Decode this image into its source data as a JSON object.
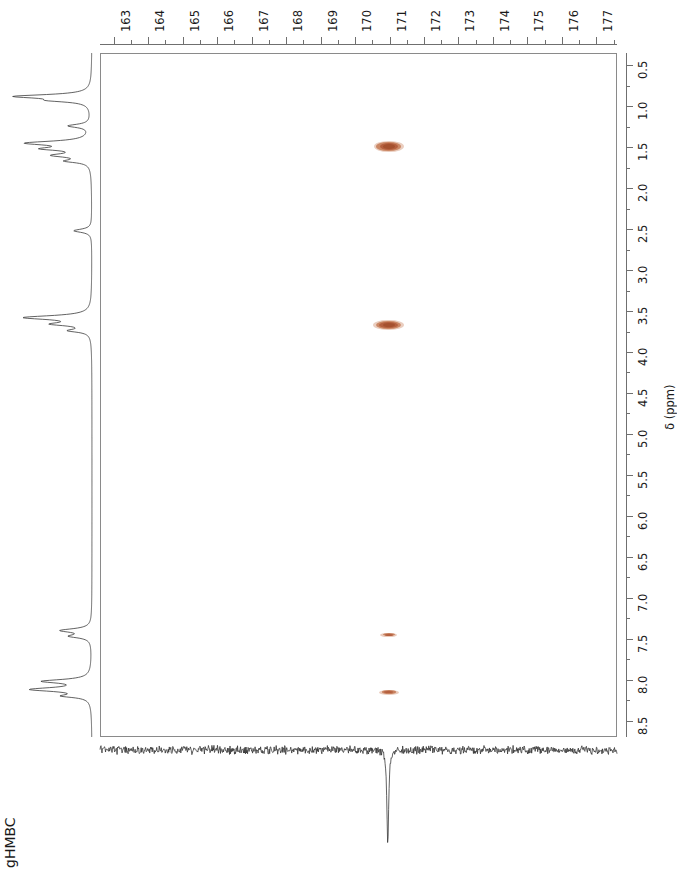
{
  "figure": {
    "experiment_label": "gHMBC",
    "axis_title_f2": "δ (ppm)"
  },
  "chart_data": {
    "type": "heatmap",
    "title": "gHMBC",
    "subtitle": "",
    "xlabel": "",
    "ylabel": "δ (ppm)",
    "x_axis_position": "top",
    "y_axis_position": "right",
    "grid": false,
    "legend": "none",
    "xlim": [
      162.6,
      177.6
    ],
    "ylim": [
      8.7,
      0.35
    ],
    "x_ticks": [
      163,
      164,
      165,
      166,
      167,
      168,
      169,
      170,
      171,
      172,
      173,
      174,
      175,
      176,
      177
    ],
    "x_tick_labels": [
      "163",
      "164",
      "165",
      "166",
      "167",
      "168",
      "169",
      "170",
      "171",
      "172",
      "173",
      "174",
      "175",
      "176",
      "177"
    ],
    "x_minor_tick_step": 0.5,
    "y_ticks": [
      0.5,
      1.0,
      1.5,
      2.0,
      2.5,
      3.0,
      3.5,
      4.0,
      4.5,
      5.0,
      5.5,
      6.0,
      6.5,
      7.0,
      7.5,
      8.0,
      8.5
    ],
    "y_tick_labels": [
      "0.5",
      "1.0",
      "1.5",
      "2.0",
      "2.5",
      "3.0",
      "3.5",
      "4.0",
      "4.5",
      "5.0",
      "5.5",
      "6.0",
      "6.5",
      "7.0",
      "7.5",
      "8.0",
      "8.5"
    ],
    "y_minor_tick_step": 0.25,
    "peak_color": "#b9653f",
    "peaks": [
      {
        "label": "cross-peak-1",
        "c13_ppm": 170.95,
        "h1_ppm": 1.48,
        "c13_width_ppm": 0.88,
        "h1_height_ppm": 0.14,
        "intensity": "strong"
      },
      {
        "label": "cross-peak-2",
        "c13_ppm": 170.95,
        "h1_ppm": 3.66,
        "c13_width_ppm": 0.9,
        "h1_height_ppm": 0.13,
        "intensity": "strong"
      },
      {
        "label": "cross-peak-3",
        "c13_ppm": 170.95,
        "h1_ppm": 7.44,
        "c13_width_ppm": 0.5,
        "h1_height_ppm": 0.055,
        "intensity": "weak"
      },
      {
        "label": "cross-peak-4",
        "c13_ppm": 170.95,
        "h1_ppm": 8.14,
        "c13_width_ppm": 0.58,
        "h1_height_ppm": 0.06,
        "intensity": "weak"
      }
    ],
    "projection_f1_proton": {
      "axis": "left",
      "description": "1D 1H projection, peaks directed left",
      "peaks_ppm": [
        0.9,
        1.25,
        1.45,
        1.62,
        2.55,
        3.6,
        3.7,
        7.42,
        7.48,
        8.05,
        8.15
      ]
    },
    "projection_f2_carbon": {
      "axis": "bottom",
      "description": "1D 13C projection, noise baseline with one large negative peak",
      "peaks_ppm": [
        170.95
      ],
      "peak_direction": "down"
    }
  }
}
